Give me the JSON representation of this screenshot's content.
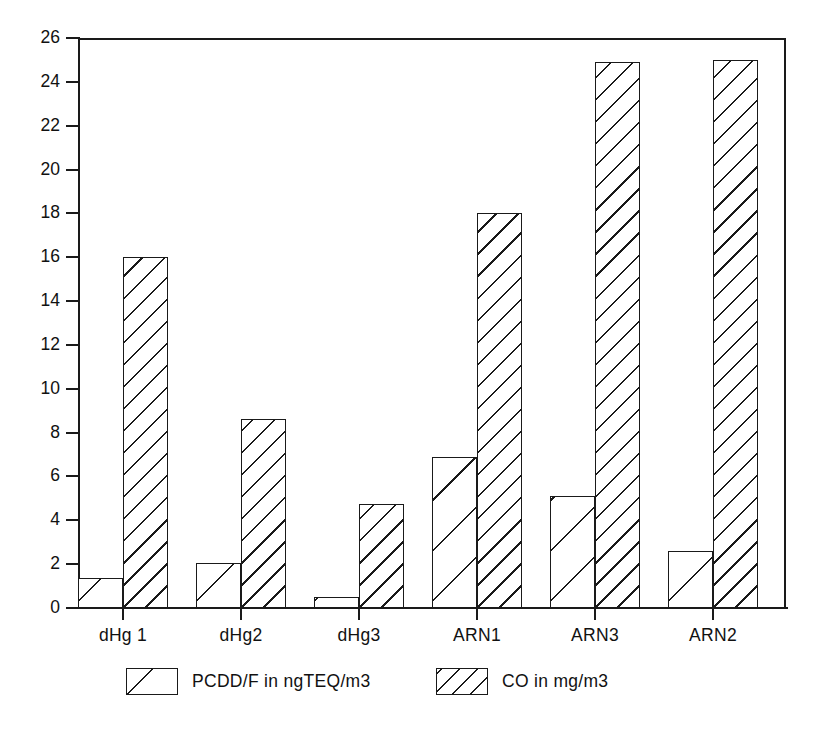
{
  "chart_data": {
    "type": "bar",
    "title": "",
    "subtitle": "",
    "xlabel": "",
    "ylabel": "",
    "ylim": [
      0,
      26
    ],
    "ytick_step": 2,
    "yticks": [
      0,
      2,
      4,
      6,
      8,
      10,
      12,
      14,
      16,
      18,
      20,
      22,
      24,
      26
    ],
    "ytick_labels": [
      "0",
      "2",
      "4",
      "6",
      "8",
      "10",
      "12",
      "14",
      "16",
      "18",
      "20",
      "22",
      "24",
      "26"
    ],
    "grid": false,
    "legend_position": "bottom",
    "categories": [
      "dHg 1",
      "dHg2",
      "dHg3",
      "ARN1",
      "ARN3",
      "ARN2"
    ],
    "series": [
      {
        "name": "PCDD/F in ngTEQ/m3",
        "pattern": "sparse-diagonal-hatch",
        "color": "#1a1a1a",
        "values": [
          1.35,
          2.05,
          0.5,
          6.9,
          5.1,
          2.6
        ]
      },
      {
        "name": "CO in mg/m3",
        "pattern": "dense-diagonal-hatch",
        "color": "#1a1a1a",
        "values": [
          16.0,
          8.6,
          4.75,
          18.0,
          24.9,
          25.0
        ]
      }
    ],
    "annotations": []
  },
  "legend": {
    "items": [
      {
        "label": "PCDD/F in ngTEQ/m3",
        "pattern": "sparse-diagonal-hatch"
      },
      {
        "label": "CO in mg/m3",
        "pattern": "dense-diagonal-hatch"
      }
    ]
  },
  "axis": {
    "y_max_label": "26",
    "y_min_label": "0"
  }
}
